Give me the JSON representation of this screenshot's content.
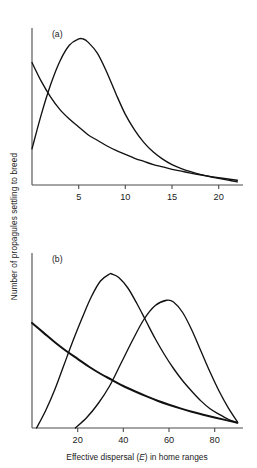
{
  "figure": {
    "ylabel": "Number of propagules settling to breed",
    "xlabel_prefix": "Effective dispersal (",
    "xlabel_symbol": "E",
    "xlabel_suffix": ") in home ranges"
  },
  "chart_data": [
    {
      "type": "line",
      "panel_label": "(a)",
      "title": "",
      "xlabel": "",
      "ylabel": "Number of propagules settling to breed",
      "xlim": [
        0,
        22.5
      ],
      "ylim": [
        0,
        1.0
      ],
      "xticks": [
        5,
        10,
        15,
        20
      ],
      "xticklabels": [
        "5",
        "10",
        "15",
        "20"
      ],
      "yticks": [],
      "yticklabels": [],
      "grid": false,
      "legend": false,
      "series": [
        {
          "name": "monotonic decline",
          "x": [
            0,
            1,
            2,
            3,
            4,
            5,
            6,
            7,
            8,
            9,
            10,
            11,
            12,
            13,
            14,
            15,
            16,
            17,
            18,
            19,
            20,
            21,
            22
          ],
          "y": [
            0.78,
            0.66,
            0.56,
            0.48,
            0.42,
            0.37,
            0.32,
            0.285,
            0.25,
            0.22,
            0.195,
            0.17,
            0.15,
            0.13,
            0.115,
            0.1,
            0.088,
            0.076,
            0.065,
            0.055,
            0.046,
            0.038,
            0.03
          ]
        },
        {
          "name": "humped curve",
          "x": [
            0,
            1,
            2,
            3,
            4,
            5,
            5.5,
            6,
            7,
            8,
            9,
            10,
            11,
            12,
            13,
            14,
            15,
            16,
            17,
            18,
            19,
            20,
            21,
            22
          ],
          "y": [
            0.23,
            0.45,
            0.64,
            0.79,
            0.89,
            0.93,
            0.93,
            0.91,
            0.84,
            0.72,
            0.58,
            0.45,
            0.35,
            0.27,
            0.21,
            0.165,
            0.13,
            0.105,
            0.085,
            0.068,
            0.054,
            0.042,
            0.031,
            0.02
          ]
        }
      ]
    },
    {
      "type": "line",
      "panel_label": "(b)",
      "title": "",
      "xlabel": "Effective dispersal (E) in home ranges",
      "ylabel": "Number of propagules settling to breed",
      "xlim": [
        0,
        92
      ],
      "ylim": [
        0,
        1.0
      ],
      "xticks": [
        20,
        40,
        60,
        80
      ],
      "xticklabels": [
        "20",
        "40",
        "60",
        "80"
      ],
      "yticks": [],
      "yticklabels": [],
      "grid": false,
      "legend": false,
      "series": [
        {
          "name": "monotonic decline",
          "x": [
            0,
            5,
            10,
            15,
            20,
            25,
            30,
            35,
            40,
            45,
            50,
            55,
            60,
            65,
            70,
            75,
            80,
            85,
            90
          ],
          "y": [
            0.6,
            0.545,
            0.49,
            0.44,
            0.395,
            0.35,
            0.31,
            0.275,
            0.24,
            0.21,
            0.182,
            0.156,
            0.133,
            0.112,
            0.093,
            0.076,
            0.06,
            0.045,
            0.03
          ]
        },
        {
          "name": "early humped curve",
          "x": [
            2,
            6,
            10,
            14,
            18,
            22,
            26,
            30,
            34,
            35,
            38,
            42,
            46,
            50,
            54,
            58,
            62,
            66,
            70,
            74,
            78,
            82,
            86,
            90
          ],
          "y": [
            0.0,
            0.1,
            0.22,
            0.36,
            0.5,
            0.63,
            0.75,
            0.84,
            0.88,
            0.88,
            0.86,
            0.8,
            0.71,
            0.61,
            0.51,
            0.42,
            0.34,
            0.27,
            0.21,
            0.155,
            0.11,
            0.078,
            0.05,
            0.03
          ]
        },
        {
          "name": "late humped curve",
          "x": [
            19,
            24,
            29,
            34,
            39,
            44,
            49,
            54,
            59,
            62,
            66,
            70,
            74,
            78,
            82,
            86,
            90
          ],
          "y": [
            0.0,
            0.06,
            0.14,
            0.24,
            0.37,
            0.5,
            0.62,
            0.7,
            0.73,
            0.72,
            0.66,
            0.56,
            0.44,
            0.32,
            0.21,
            0.115,
            0.035
          ]
        }
      ]
    }
  ]
}
